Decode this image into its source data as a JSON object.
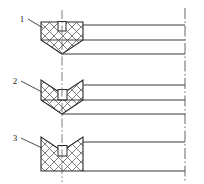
{
  "drawing": {
    "title": "Seal cross-section profile variants",
    "type": "engineering-cross-section",
    "background_color": "#ffffff",
    "line_color": "#2b2b2b",
    "hatch_color": "#6b6b6b",
    "centerline_color": "#555555",
    "canvas": {
      "width": 204,
      "height": 184
    },
    "callouts": [
      {
        "id": "callout-1",
        "label": "1",
        "text_x": 22,
        "text_y": 22,
        "leader_from_x": 28,
        "leader_from_y": 19,
        "leader_to_x": 43,
        "leader_to_y": 28
      },
      {
        "id": "callout-2",
        "label": "2",
        "text_x": 15,
        "text_y": 84,
        "leader_from_x": 21,
        "leader_from_y": 81,
        "leader_to_x": 42,
        "leader_to_y": 92
      },
      {
        "id": "callout-3",
        "label": "3",
        "text_x": 15,
        "text_y": 141,
        "leader_from_x": 21,
        "leader_from_y": 138,
        "leader_to_x": 42,
        "leader_to_y": 148
      }
    ],
    "profiles": [
      {
        "id": "profile-1",
        "name": "flat-top-v-bottom-profile",
        "label": "1",
        "description": "Flat top with central rectangular slot, V-pointed bottom",
        "outline": "M 41,22 L 83,22 L 83,40 L 62,54 L 41,40 Z",
        "slot": {
          "x": 58,
          "y": 22,
          "width": 8,
          "height": 9
        },
        "hatch_region": "M 41,22 L 83,22 L 83,40 L 62,54 L 41,40 Z",
        "extension_lines": [
          {
            "x1": 83,
            "y1": 25,
            "x2": 185,
            "y2": 25
          },
          {
            "x1": 83,
            "y1": 40,
            "x2": 185,
            "y2": 40
          },
          {
            "x1": 62,
            "y1": 54,
            "x2": 185,
            "y2": 54
          }
        ]
      },
      {
        "id": "profile-2",
        "name": "v-notch-top-v-bottom-profile",
        "label": "2",
        "description": "V-notched top, V-pointed bottom, central square slot",
        "outline": "M 41,80 L 41,100 L 62,114 L 83,100 L 83,80 L 62,94 Z",
        "slot": {
          "x": 58,
          "y": 90,
          "width": 9,
          "height": 10
        },
        "extension_lines": [
          {
            "x1": 83,
            "y1": 85,
            "x2": 185,
            "y2": 85
          },
          {
            "x1": 83,
            "y1": 100,
            "x2": 185,
            "y2": 100
          },
          {
            "x1": 62,
            "y1": 114,
            "x2": 185,
            "y2": 114
          }
        ]
      },
      {
        "id": "profile-3",
        "name": "v-notch-top-flat-bottom-profile",
        "label": "3",
        "description": "Rectangular body with V-notched top and flat bottom, central square slot",
        "outline": "M 41,137 L 41,171 L 83,171 L 83,137 L 62,151 Z",
        "slot": {
          "x": 58,
          "y": 146,
          "width": 9,
          "height": 10
        },
        "extension_lines": [
          {
            "x1": 83,
            "y1": 142,
            "x2": 185,
            "y2": 142
          },
          {
            "x1": 83,
            "y1": 171,
            "x2": 185,
            "y2": 171
          }
        ]
      }
    ],
    "centerlines": {
      "vertical_axis": {
        "x": 62,
        "y1": 10,
        "y2": 182,
        "style": "dash-dot"
      },
      "right_axis": {
        "x": 185,
        "y1": 8,
        "y2": 182,
        "style": "dash-dot"
      }
    }
  }
}
